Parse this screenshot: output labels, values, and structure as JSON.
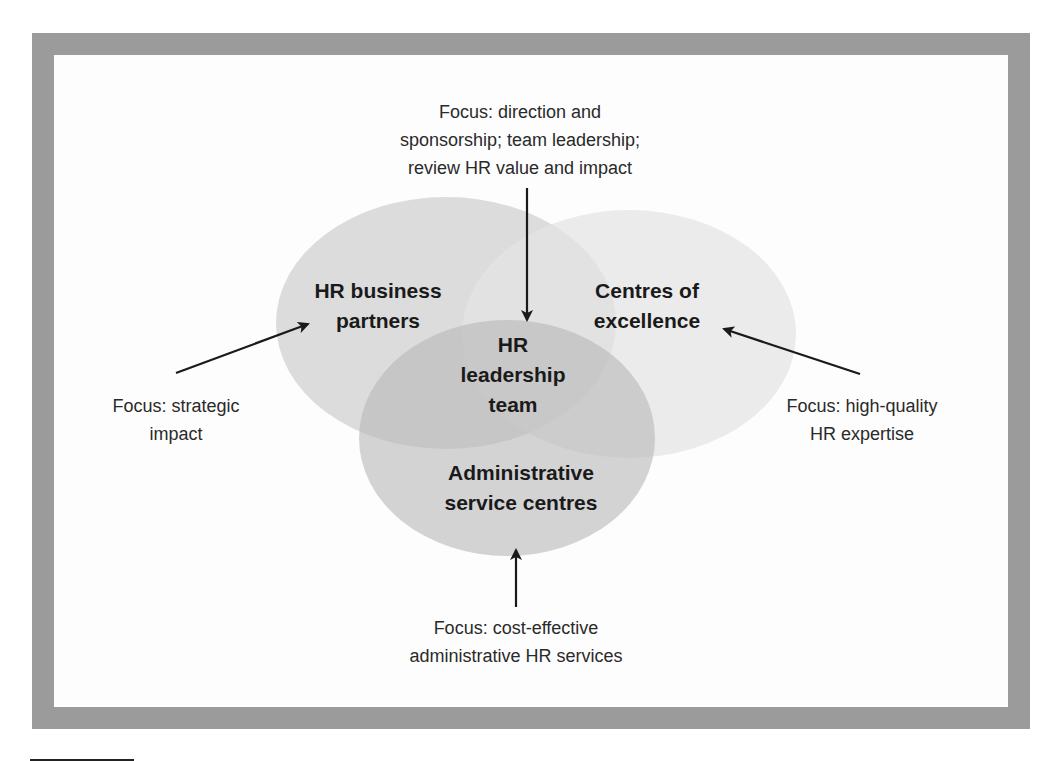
{
  "diagram": {
    "colors": {
      "frame": "#9b9b9b",
      "circle_left": "#d4d4d4",
      "circle_right": "#e6e6e6",
      "circle_bottom": "#c2c2c2",
      "arrow": "#1a1a1a",
      "text": "#1a1a1a"
    },
    "circles": {
      "left": {
        "label_line1": "HR business",
        "label_line2": "partners"
      },
      "right": {
        "label_line1": "Centres of",
        "label_line2": "excellence"
      },
      "bottom": {
        "label_line1": "Administrative",
        "label_line2": "service centres"
      },
      "center": {
        "label_line1": "HR",
        "label_line2": "leadership",
        "label_line3": "team"
      }
    },
    "focus": {
      "top": {
        "line1": "Focus: direction and",
        "line2": "sponsorship; team leadership;",
        "line3": "review HR value and impact"
      },
      "left": {
        "line1": "Focus: strategic",
        "line2": "impact"
      },
      "right": {
        "line1": "Focus: high-quality",
        "line2": "HR expertise"
      },
      "bottom": {
        "line1": "Focus: cost-effective",
        "line2": "administrative HR services"
      }
    }
  }
}
